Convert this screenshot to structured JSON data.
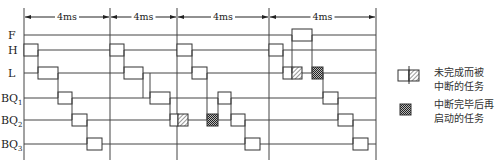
{
  "diagram": {
    "title": "",
    "interval_label": "4ms",
    "intervals": [
      {
        "label": "4ms",
        "x1": 24,
        "x2": 110
      },
      {
        "label": "4ms",
        "x1": 110,
        "x2": 177
      },
      {
        "label": "4ms",
        "x1": 177,
        "x2": 269
      },
      {
        "label": "4ms",
        "x1": 269,
        "x2": 376
      }
    ],
    "grid_lines_x": [
      24,
      110,
      177,
      269,
      376
    ],
    "rows": [
      {
        "id": "F",
        "label": "F",
        "sub": "",
        "y": 35
      },
      {
        "id": "H",
        "label": "H",
        "sub": "",
        "y": 50
      },
      {
        "id": "L",
        "label": "L",
        "sub": "",
        "y": 73
      },
      {
        "id": "BQ1",
        "label": "BQ",
        "sub": "1",
        "y": 98
      },
      {
        "id": "BQ2",
        "label": "BQ",
        "sub": "2",
        "y": 120
      },
      {
        "id": "BQ3",
        "label": "BQ",
        "sub": "3",
        "y": 144
      }
    ],
    "tasks": [
      {
        "row": "H",
        "x1": 24,
        "x2": 38,
        "type": "normal"
      },
      {
        "row": "L",
        "x1": 38,
        "x2": 58,
        "type": "normal"
      },
      {
        "row": "BQ1",
        "x1": 58,
        "x2": 72,
        "type": "normal"
      },
      {
        "row": "BQ2",
        "x1": 72,
        "x2": 87,
        "type": "normal"
      },
      {
        "row": "BQ3",
        "x1": 87,
        "x2": 102,
        "type": "normal"
      },
      {
        "row": "H",
        "x1": 110,
        "x2": 124,
        "type": "normal"
      },
      {
        "row": "L",
        "x1": 124,
        "x2": 143,
        "type": "normal"
      },
      {
        "row": "BQ1",
        "x1": 150,
        "x2": 170,
        "type": "normal"
      },
      {
        "row": "BQ2",
        "x1": 170,
        "x2": 178,
        "type": "normal"
      },
      {
        "row": "BQ2",
        "x1": 178,
        "x2": 188,
        "type": "interrupted"
      },
      {
        "row": "H",
        "x1": 177,
        "x2": 192,
        "type": "normal"
      },
      {
        "row": "L",
        "x1": 192,
        "x2": 207,
        "type": "normal"
      },
      {
        "row": "BQ2",
        "x1": 207,
        "x2": 218,
        "type": "resumed"
      },
      {
        "row": "BQ1",
        "x1": 218,
        "x2": 231,
        "type": "normal"
      },
      {
        "row": "BQ2",
        "x1": 231,
        "x2": 245,
        "type": "normal"
      },
      {
        "row": "BQ3",
        "x1": 245,
        "x2": 260,
        "type": "normal"
      },
      {
        "row": "H",
        "x1": 269,
        "x2": 283,
        "type": "normal"
      },
      {
        "row": "L",
        "x1": 283,
        "x2": 292,
        "type": "normal"
      },
      {
        "row": "F",
        "x1": 292,
        "x2": 312,
        "type": "normal"
      },
      {
        "row": "L",
        "x1": 292,
        "x2": 302,
        "type": "interrupted"
      },
      {
        "row": "L",
        "x1": 312,
        "x2": 323,
        "type": "resumed"
      },
      {
        "row": "BQ1",
        "x1": 323,
        "x2": 338,
        "type": "normal"
      },
      {
        "row": "BQ2",
        "x1": 338,
        "x2": 353,
        "type": "normal"
      },
      {
        "row": "BQ3",
        "x1": 353,
        "x2": 368,
        "type": "normal"
      }
    ]
  },
  "legend": {
    "items": [
      {
        "type": "interrupted",
        "text_line1": "未完成而被",
        "text_line2": "中断的任务"
      },
      {
        "type": "resumed",
        "text_line1": "中断完毕后再",
        "text_line2": "启动的任务"
      }
    ]
  },
  "colors": {
    "line": "#444444",
    "box_fill": "#ffffff",
    "hatch": "#555555",
    "crosshatch": "#333333"
  }
}
